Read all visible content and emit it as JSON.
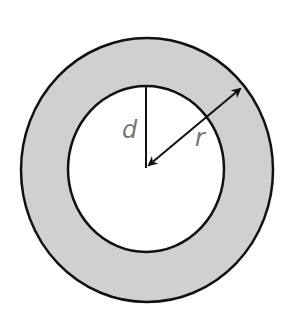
{
  "diagram": {
    "type": "annulus",
    "labels": {
      "inner": "d",
      "outer": "r"
    },
    "colors": {
      "ring_fill": "#d0d0d0",
      "stroke": "#111111",
      "label": "#777777",
      "background": "#ffffff"
    }
  }
}
